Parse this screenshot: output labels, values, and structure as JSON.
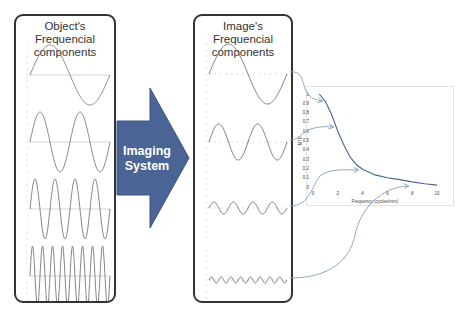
{
  "left_panel": {
    "title_line1": "Object's Frequencial",
    "title_line2": "components"
  },
  "right_panel": {
    "title_line1": "Image's Frequencial",
    "title_line2": "components"
  },
  "imaging_arrow": {
    "line1": "Imaging",
    "line2": "System",
    "color": "#4a6496"
  },
  "chart_data": {
    "type": "line",
    "title": "",
    "xlabel": "Frequency (cycles/mm)",
    "ylabel": "MTF",
    "x_ticks": [
      "0",
      "2",
      "4",
      "6",
      "8",
      "10"
    ],
    "y_ticks": [
      "0",
      "0.1",
      "0.2",
      "0.3",
      "0.4",
      "0.5",
      "0.6",
      "0.7",
      "0.8",
      "0.9",
      "1"
    ],
    "xlim": [
      0,
      10
    ],
    "ylim": [
      0,
      1
    ],
    "series": [
      {
        "name": "MTF",
        "x": [
          0.5,
          1,
          1.5,
          2,
          2.5,
          3,
          3.5,
          4,
          5,
          6,
          7,
          8,
          9,
          10
        ],
        "y": [
          1.0,
          0.92,
          0.78,
          0.6,
          0.45,
          0.32,
          0.24,
          0.19,
          0.13,
          0.1,
          0.08,
          0.055,
          0.035,
          0.02
        ]
      }
    ],
    "highlighted_points": [
      {
        "x": 1,
        "y": 0.9
      },
      {
        "x": 2,
        "y": 0.6
      },
      {
        "x": 4,
        "y": 0.2
      },
      {
        "x": 8,
        "y": 0.05
      }
    ],
    "grid": false,
    "line_color": "#4a6496"
  },
  "components": [
    {
      "label": "low frequency",
      "object_cycles": 1,
      "image_amplitude": 1.0
    },
    {
      "label": "medium frequency",
      "object_cycles": 2,
      "image_amplitude": 0.6
    },
    {
      "label": "high frequency",
      "object_cycles": 4,
      "image_amplitude": 0.2
    },
    {
      "label": "very high frequency",
      "object_cycles": 8,
      "image_amplitude": 0.05
    }
  ]
}
